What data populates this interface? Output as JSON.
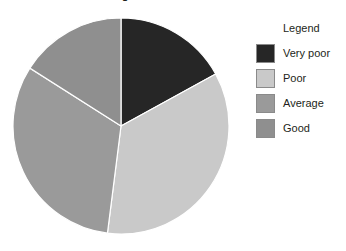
{
  "chart_data": {
    "type": "pie",
    "title": "",
    "title_clipped": "g",
    "categories": [
      "Very poor",
      "Poor",
      "Average",
      "Good"
    ],
    "values": [
      17,
      35,
      32,
      16
    ],
    "units": "percent",
    "colors": [
      "#262626",
      "#c9c9c9",
      "#9a9a9a",
      "#8f8f8f"
    ],
    "start_angle_deg": 0,
    "direction": "clockwise",
    "boundary_angles_deg": [
      0,
      62,
      189,
      304,
      360
    ],
    "legend_position": "right",
    "grid": false,
    "xlabel": "",
    "ylabel": "",
    "data_labels_shown": false
  },
  "legend": {
    "title": "Legend",
    "items": [
      {
        "label": "Very poor",
        "color": "#262626"
      },
      {
        "label": "Poor",
        "color": "#c9c9c9"
      },
      {
        "label": "Average",
        "color": "#9a9a9a"
      },
      {
        "label": "Good",
        "color": "#8f8f8f"
      }
    ]
  }
}
